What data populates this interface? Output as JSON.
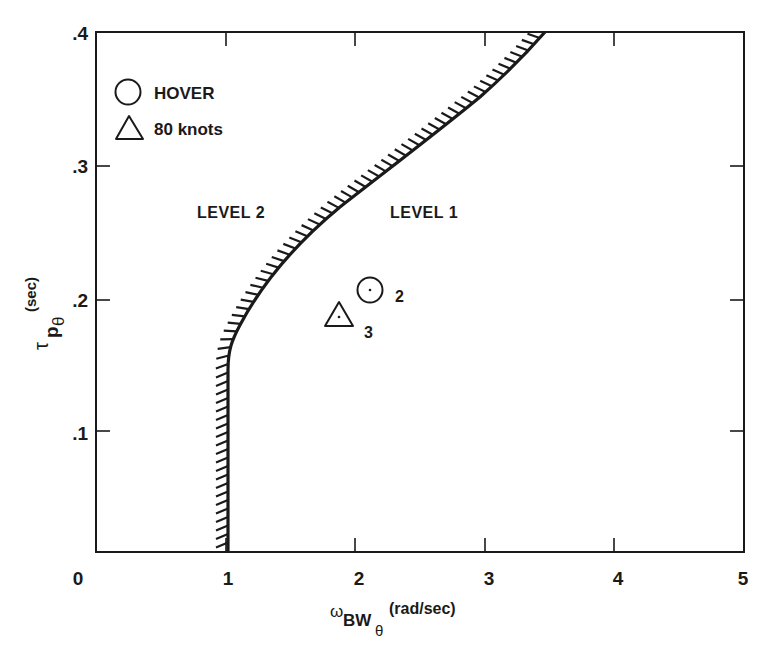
{
  "chart_data": {
    "type": "scatter",
    "title": "",
    "xlabel": "ωBWθ (rad/sec)",
    "ylabel": "τpθ (sec)",
    "xlim": [
      0,
      5
    ],
    "ylim": [
      0.009,
      0.4
    ],
    "x_ticks": [
      "0",
      "1",
      "2",
      "3",
      "4",
      "5"
    ],
    "y_ticks": [
      ".1",
      ".2",
      ".3",
      ".4"
    ],
    "grid": false,
    "legend": {
      "position": "upper-left",
      "entries": [
        {
          "marker": "circle",
          "label": "HOVER"
        },
        {
          "marker": "triangle",
          "label": "80 knots"
        }
      ]
    },
    "boundary": {
      "name": "Level 1 / Level 2 boundary",
      "hatched_side": "left",
      "points": [
        [
          0.99,
          0.009
        ],
        [
          0.99,
          0.14
        ],
        [
          1.02,
          0.155
        ],
        [
          1.15,
          0.185
        ],
        [
          1.4,
          0.225
        ],
        [
          1.75,
          0.265
        ],
        [
          2.2,
          0.305
        ],
        [
          2.6,
          0.34
        ],
        [
          3.0,
          0.37
        ],
        [
          3.45,
          0.4
        ]
      ]
    },
    "regions": [
      {
        "label": "LEVEL 2",
        "side": "left"
      },
      {
        "label": "LEVEL 1",
        "side": "right"
      }
    ],
    "series": [
      {
        "name": "HOVER",
        "marker": "circle",
        "points": [
          {
            "x": 2.12,
            "y": 0.206,
            "label": "2"
          }
        ]
      },
      {
        "name": "80 knots",
        "marker": "triangle",
        "points": [
          {
            "x": 1.87,
            "y": 0.188,
            "label": "3"
          }
        ]
      }
    ]
  },
  "labels": {
    "level1": "LEVEL 1",
    "level2": "LEVEL 2",
    "legend_hover": "HOVER",
    "legend_80": "80 knots",
    "pt_hover": "2",
    "pt_80": "3",
    "x_tick_0": "0",
    "x_tick_1": "1",
    "x_tick_2": "2",
    "x_tick_3": "3",
    "x_tick_4": "4",
    "x_tick_5": "5",
    "y_tick_1": ".1",
    "y_tick_2": ".2",
    "y_tick_3": ".3",
    "y_tick_4": ".4",
    "xlabel_main": "ω",
    "xlabel_sub": "BW",
    "xlabel_subsub": "θ",
    "xlabel_units": "(rad/sec)",
    "ylabel_main": "τ",
    "ylabel_sub": "p",
    "ylabel_subsub": "θ",
    "ylabel_units": "(sec)"
  },
  "colors": {
    "ink": "#1a1a1a",
    "background": "#ffffff"
  }
}
